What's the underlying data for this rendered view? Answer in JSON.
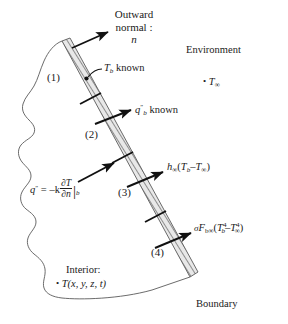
{
  "figure": {
    "background": "#ffffff",
    "ink": "#1a1a1a",
    "hatch_color": "#8a8a8a"
  },
  "labels": {
    "outward_normal_line1": "Outward",
    "outward_normal_line2": "normal :",
    "outward_normal_symbol": "n",
    "environment": "Environment",
    "environment_temp": "T",
    "environment_temp_sub": "∞",
    "boundary": "Boundary",
    "interior_title": "Interior:",
    "interior_field": "T(x, y, z, t)",
    "bullet": "•"
  },
  "segments": [
    {
      "id": "seg1",
      "tag": "(1)",
      "condition_kind": "prescribed-temperature",
      "label_main": "T",
      "label_sub": "b",
      "label_rest": " known"
    },
    {
      "id": "seg2",
      "tag": "(2)",
      "condition_kind": "prescribed-heat-flux",
      "label_main": "q",
      "label_sup": "″",
      "label_sub": "b",
      "label_rest": " known"
    },
    {
      "id": "seg3",
      "tag": "(3)",
      "condition_kind": "convection",
      "label_h": "h",
      "label_h_sub": "∞",
      "label_open": "(",
      "label_tb": "T",
      "label_tb_sub": "b",
      "label_minus": "–",
      "label_tinf": "T",
      "label_tinf_sub": "∞",
      "label_close": ")"
    },
    {
      "id": "seg4",
      "tag": "(4)",
      "condition_kind": "radiation",
      "label_sigma": "σ",
      "label_F": "F",
      "label_F_sub": "b∞",
      "label_open": "(",
      "label_tb": "T",
      "label_tb_sub": "b",
      "label_tb_sup": "4",
      "label_minus": "–",
      "label_tinf": "T",
      "label_tinf_sub": "∞",
      "label_tinf_sup": "4",
      "label_close": ")"
    }
  ],
  "flux_law": {
    "lhs": "q",
    "lhs_sup": "″",
    "eq": "= –k",
    "frac_num": "∂T",
    "frac_den": "∂n",
    "eval_bar": "|",
    "eval_sub": "b"
  }
}
